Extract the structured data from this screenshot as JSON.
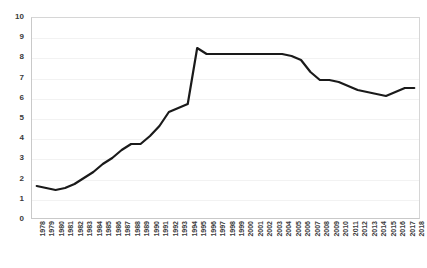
{
  "chart_data": {
    "type": "line",
    "title": "",
    "subtitle": "",
    "xlabel": "",
    "ylabel": "",
    "xlim": [
      1978,
      2018
    ],
    "ylim": [
      0,
      10
    ],
    "grid": true,
    "legend": false,
    "legend_position": "none",
    "line_color": "#1a1a1a",
    "line_width": 2.2,
    "y_ticks": [
      0,
      1,
      2,
      3,
      4,
      5,
      6,
      7,
      8,
      9,
      10
    ],
    "categories": [
      "1978",
      "1979",
      "1980",
      "1981",
      "1982",
      "1983",
      "1984",
      "1985",
      "1986",
      "1987",
      "1988",
      "1989",
      "1990",
      "1991",
      "1992",
      "1993",
      "1994",
      "1995",
      "1996",
      "1997",
      "1998",
      "1999",
      "2000",
      "2001",
      "2002",
      "2003",
      "2004",
      "2005",
      "2006",
      "2007",
      "2008",
      "2009",
      "2010",
      "2011",
      "2012",
      "2013",
      "2014",
      "2015",
      "2016",
      "2017",
      "2018"
    ],
    "values": [
      1.6,
      1.5,
      1.4,
      1.5,
      1.7,
      2.0,
      2.3,
      2.7,
      3.0,
      3.4,
      3.7,
      3.7,
      4.1,
      4.6,
      5.3,
      5.5,
      5.7,
      8.5,
      8.2,
      8.2,
      8.2,
      8.2,
      8.2,
      8.2,
      8.2,
      8.2,
      8.2,
      8.1,
      7.9,
      7.3,
      6.9,
      6.9,
      6.8,
      6.6,
      6.4,
      6.3,
      6.2,
      6.1,
      6.3,
      6.5,
      6.5
    ]
  }
}
